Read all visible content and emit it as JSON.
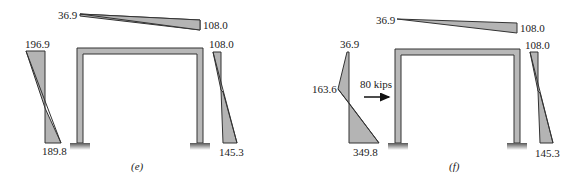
{
  "figure": {
    "panel_e": {
      "caption": "(e)",
      "beam_moments": {
        "left": "36.9",
        "right": "108.0"
      },
      "left_column_moments": {
        "top": "196.9",
        "bottom": "189.8"
      },
      "right_column_moments": {
        "top": "108.0",
        "bottom": "145.3"
      }
    },
    "panel_f": {
      "caption": "(f)",
      "beam_moments": {
        "left": "36.9",
        "right": "108.0"
      },
      "left_column_moments": {
        "top": "36.9",
        "load_point": "163.6",
        "bottom": "349.8"
      },
      "right_column_moments": {
        "top": "108.0",
        "bottom": "145.3"
      },
      "load": {
        "label": "80 kips",
        "direction": "right"
      }
    },
    "colors": {
      "diagram_fill": "#b4b4b4",
      "outline": "#333333",
      "frame_fill": "#b8b8b8"
    }
  }
}
